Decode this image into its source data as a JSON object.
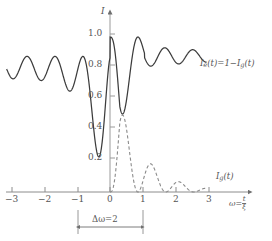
{
  "chart_data": {
    "type": "line",
    "title": "",
    "xlabel": "ω = t/ξ",
    "ylabel": "I",
    "xlim": [
      -3.35,
      3.35
    ],
    "ylim": [
      0.0,
      1.08
    ],
    "grid": false,
    "legend_position": "inside-right",
    "x_ticks": [
      -3,
      -2,
      -1,
      0,
      1,
      2,
      3
    ],
    "x_tick_labels": [
      "−3",
      "−2",
      "−1",
      "0",
      "1",
      "2",
      "3"
    ],
    "y_ticks": [
      0.2,
      0.4,
      0.6,
      0.8,
      1.0
    ],
    "y_tick_labels": [
      "0.2",
      "0.4",
      "0.6",
      "0.8",
      "1.0"
    ],
    "series": [
      {
        "name": "I_e(t) = 1 − I_g(t)",
        "style": "solid",
        "color": "#3c3c3c",
        "model": "one_minus_decaying_rabi",
        "description": "Damped oscillation complementary to the dashed curve; envelope decays away from the centre towards a baseline near 0.87, deepest minima near ω = −0.5 (0.22) and ω = 0.35 (0.24).",
        "baseline": 0.87,
        "min_value": 0.22,
        "max_value": 0.96
      },
      {
        "name": "I_g(t)",
        "style": "dashed",
        "color": "#8a8a8a",
        "model": "decaying_rabi",
        "description": "Decaying oscillation starting at 0 for ω < 0, rising to a first peak of about 0.78 near ω = 0.65 then damping towards 0 for large ω.",
        "baseline": 0.0,
        "min_value": 0.0,
        "max_value": 0.78
      }
    ],
    "annotations": [
      {
        "name": "width-marker",
        "label": "Δω=2",
        "from_x": -1,
        "to_x": 1,
        "value": 2
      }
    ]
  },
  "axes": {
    "y_axis_label": "I",
    "x_axis_label_main": "ω",
    "x_axis_label_equals": "=",
    "x_axis_label_frac_num": "t",
    "x_axis_label_frac_den": "ξ",
    "x_tick_labels": [
      "−3",
      "−2",
      "−1",
      "0",
      "1",
      "2",
      "3"
    ],
    "y_tick_labels": [
      "1.0",
      "0.8",
      "0.6",
      "0.4",
      "0.2"
    ]
  },
  "labels": {
    "solid_curve": {
      "prefix_I": "I",
      "prefix_sub": "e",
      "body": "(t)=1−I",
      "body_sub": "g",
      "suffix": "(t)"
    },
    "dashed_curve": {
      "prefix_I": "I",
      "prefix_sub": "g",
      "suffix": "(t)"
    },
    "width_annotation": "Δω=2"
  },
  "colors": {
    "solid_curve": "#3c3c3c",
    "dashed_curve": "#8a8a8a",
    "axis": "#8c8c8c",
    "text": "#555555",
    "background": "#ffffff"
  }
}
